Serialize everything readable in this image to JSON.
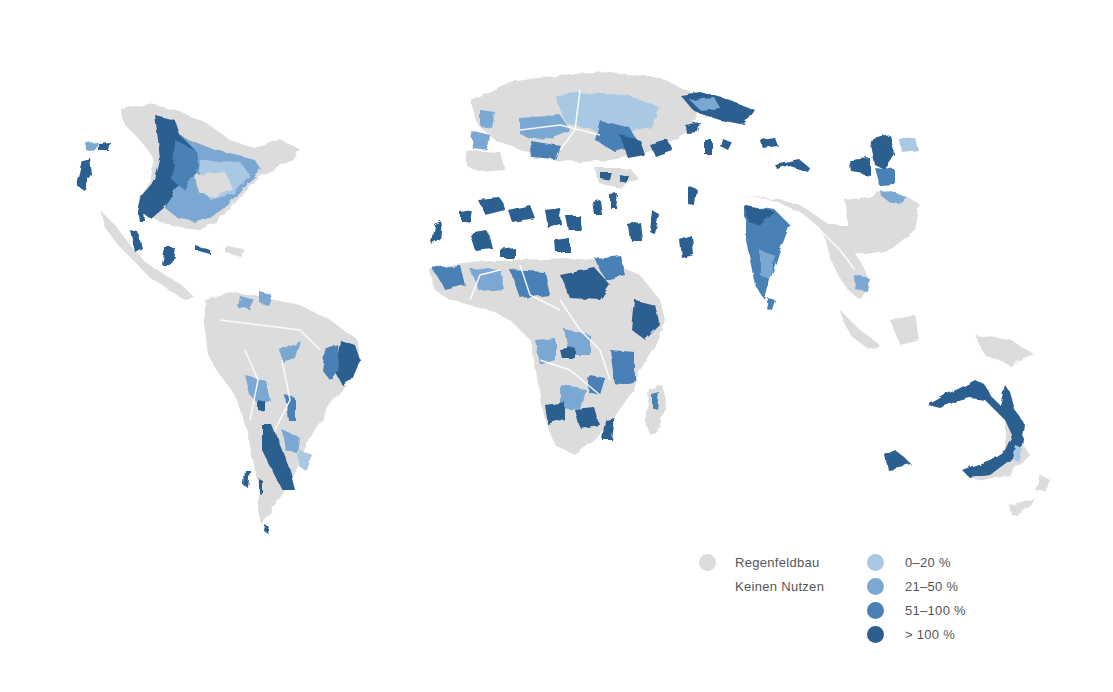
{
  "map": {
    "type": "choropleth-world",
    "projection": "world (Pacific-cut, Europe/Africa centered)",
    "colors": {
      "background": "#ffffff",
      "rainfed": "#dcdcdc",
      "border": "#ffffff",
      "class_0_20": "#a9c8e3",
      "class_21_50": "#7aa8d2",
      "class_51_100": "#4a80b5",
      "class_gt_100": "#2c5f8f"
    }
  },
  "legend": {
    "left": [
      {
        "label": "Regenfeldbau",
        "color": "#dcdcdc"
      },
      {
        "label": "Keinen Nutzen",
        "color": null
      }
    ],
    "right": [
      {
        "label": "0–20 %",
        "color": "#a9c8e3"
      },
      {
        "label": "21–50 %",
        "color": "#7aa8d2"
      },
      {
        "label": "51–100 %",
        "color": "#4a80b5"
      },
      {
        "label": "> 100 %",
        "color": "#2c5f8f"
      }
    ]
  }
}
